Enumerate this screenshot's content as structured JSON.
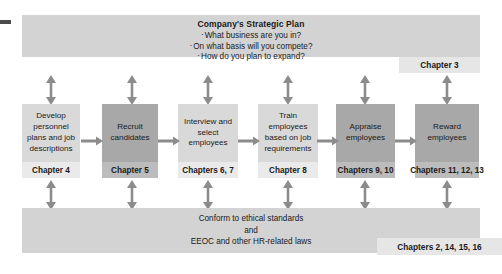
{
  "diagram": {
    "title_block": {
      "title": "Company's Strategic Plan",
      "bullets": [
        "What business are you in?",
        "On what basis will you compete?",
        "How do you plan to expand?"
      ],
      "chapter_label": "Chapter 3"
    },
    "process_steps": [
      {
        "label": "Develop\npersonnel\nplans and job\ndescriptions",
        "chapter": "Chapter 4",
        "shade": "light"
      },
      {
        "label": "Recruit\ncandidates",
        "chapter": "Chapter 5",
        "shade": "dark"
      },
      {
        "label": "Interview and\nselect\nemployees",
        "chapter": "Chapters 6, 7",
        "shade": "light"
      },
      {
        "label": "Train\nemployees\nbased on job\nrequirements",
        "chapter": "Chapter 8",
        "shade": "light"
      },
      {
        "label": "Appraise\nemployees",
        "chapter": "Chapters 9, 10",
        "shade": "dark"
      },
      {
        "label": "Reward\nemployees",
        "chapter": "Chapters 11, 12, 13",
        "shade": "dark"
      }
    ],
    "compliance_block": {
      "lines": [
        "Conform to ethical standards",
        "and",
        "EEOC and other HR-related laws"
      ],
      "chapter_label": "Chapters 2, 14, 15, 16"
    },
    "bullet_glyph": "·",
    "colors": {
      "band": "#d3d3d3",
      "box_light": "#d9d9d9",
      "box_light_footer": "#eaeaea",
      "box_dark": "#a8a8a8",
      "box_dark_footer": "#bcbcbc",
      "callout": "#e6e6e6",
      "arrow": "#8c8c8c",
      "text": "#1a1a1a",
      "background": "#ffffff",
      "edge_mark": "#4a4a4a"
    },
    "arrows": {
      "vertical_top_count": 6,
      "vertical_bottom_count": 6,
      "horizontal_count": 5,
      "vertical_style": "double-headed",
      "horizontal_style": "single-headed-right"
    }
  }
}
